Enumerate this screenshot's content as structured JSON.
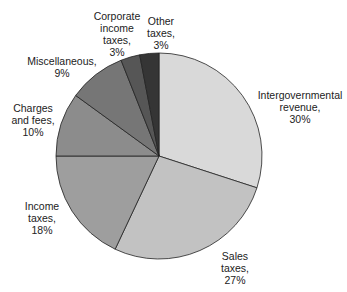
{
  "chart_data": {
    "type": "pie",
    "title": "",
    "start_angle_deg": 0,
    "direction": "clockwise",
    "slices": [
      {
        "label": "Intergovernmental revenue",
        "value": 30,
        "color": "#d9d9d9"
      },
      {
        "label": "Sales taxes",
        "value": 27,
        "color": "#c2c2c2"
      },
      {
        "label": "Income taxes",
        "value": 18,
        "color": "#9e9e9e"
      },
      {
        "label": "Charges and fees",
        "value": 10,
        "color": "#8c8c8c"
      },
      {
        "label": "Miscellaneous",
        "value": 9,
        "color": "#767676"
      },
      {
        "label": "Corporate income taxes",
        "value": 3,
        "color": "#565656"
      },
      {
        "label": "Other taxes",
        "value": 3,
        "color": "#353535"
      }
    ]
  },
  "labels": [
    {
      "text": "Intergovernmental\nrevenue,\n30%",
      "x": 250,
      "y": 89,
      "w": 100
    },
    {
      "text": "Sales\ntaxes,\n27%",
      "x": 215,
      "y": 250,
      "w": 40
    },
    {
      "text": "Income\ntaxes,\n18%",
      "x": 18,
      "y": 200,
      "w": 48
    },
    {
      "text": "Charges\nand fees,\n10%",
      "x": 6,
      "y": 102,
      "w": 54
    },
    {
      "text": "Miscellaneous,\n9%",
      "x": 22,
      "y": 55,
      "w": 80
    },
    {
      "text": "Corporate\nincome\ntaxes,\n3%",
      "x": 89,
      "y": 10,
      "w": 56
    },
    {
      "text": "Other\ntaxes,\n3%",
      "x": 143,
      "y": 15,
      "w": 36
    }
  ]
}
